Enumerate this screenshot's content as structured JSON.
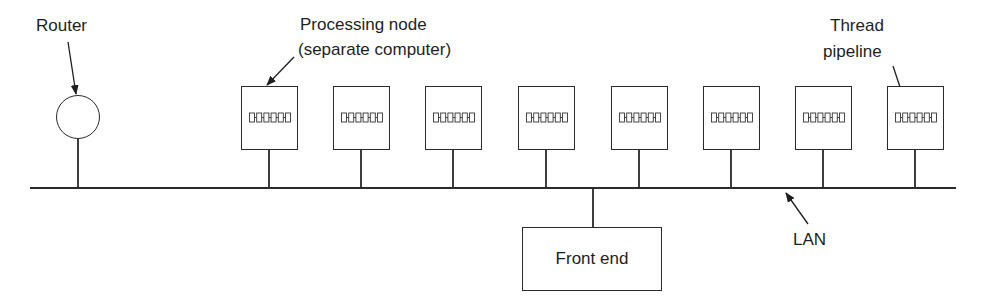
{
  "diagram": {
    "labels": {
      "router": "Router",
      "processing_node_line1": "Processing node",
      "processing_node_line2": "(separate computer)",
      "thread_pipeline_line1": "Thread",
      "thread_pipeline_line2": "pipeline",
      "front_end": "Front end",
      "lan": "LAN"
    },
    "processing_nodes": [
      {
        "id": 1,
        "x": 241
      },
      {
        "id": 2,
        "x": 333
      },
      {
        "id": 3,
        "x": 425
      },
      {
        "id": 4,
        "x": 518
      },
      {
        "id": 5,
        "x": 611
      },
      {
        "id": 6,
        "x": 703
      },
      {
        "id": 7,
        "x": 795
      },
      {
        "id": 8,
        "x": 887
      }
    ],
    "pipeline_stages_per_node": 6,
    "colors": {
      "line": "#2a2a2a",
      "text": "#1e1e1e",
      "background": "#ffffff"
    }
  }
}
